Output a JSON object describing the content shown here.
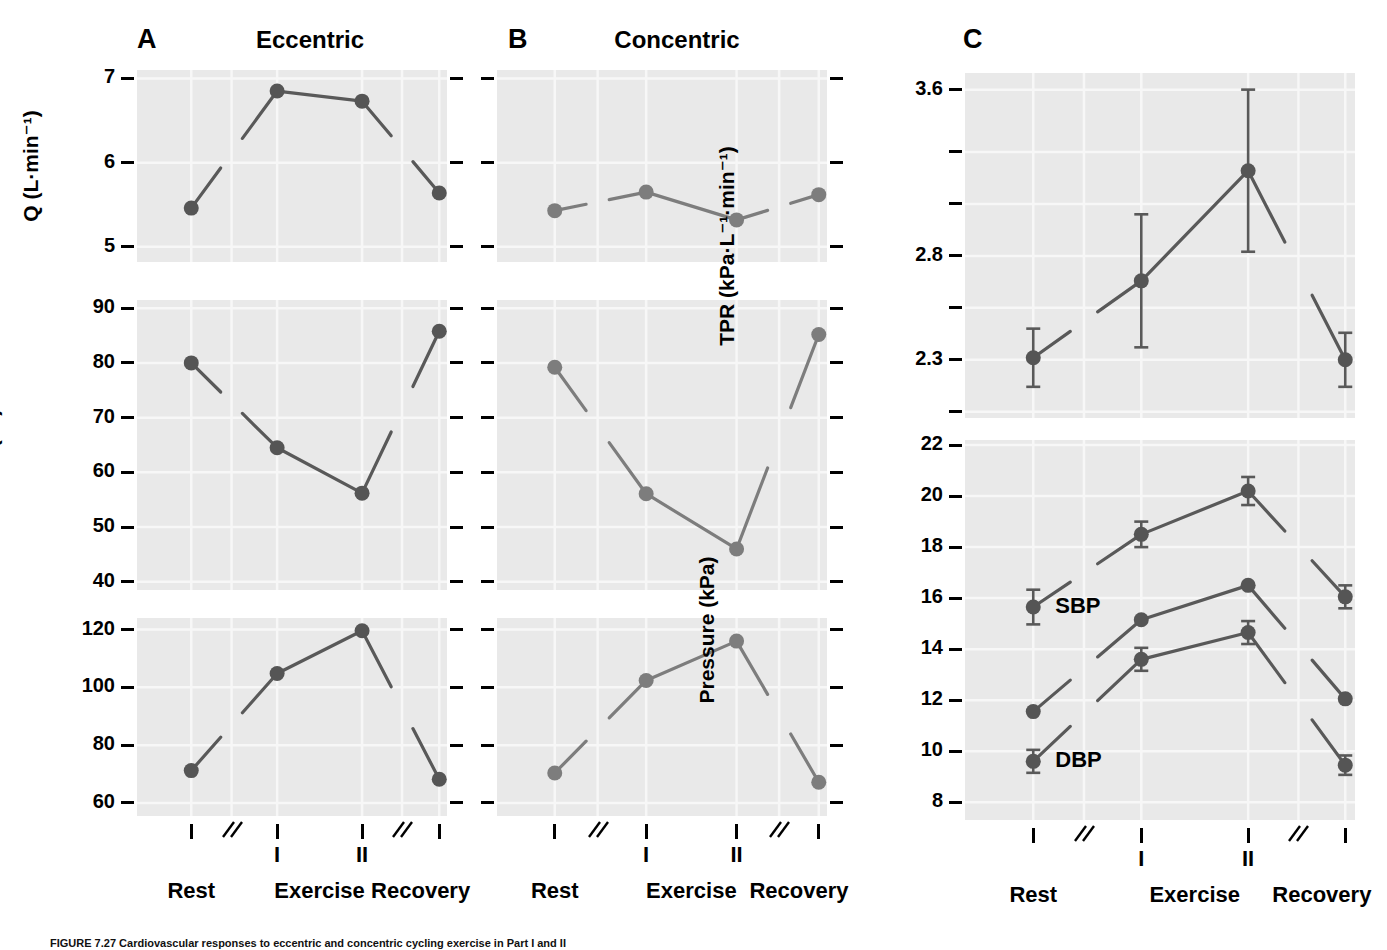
{
  "figure": {
    "caption": "FIGURE 7.27  Cardiovascular responses to eccentric and concentric cycling exercise in Part I and II",
    "columns": [
      {
        "letter": "A",
        "title": "Eccentric"
      },
      {
        "letter": "B",
        "title": "Concentric"
      },
      {
        "letter": "C",
        "title": ""
      }
    ],
    "x_categories": [
      "Rest",
      "Exercise",
      "Recovery"
    ],
    "x_roman": [
      "I",
      "II"
    ],
    "axis_break_symbol": "//",
    "colors": {
      "plot_background": "#e9e9e9",
      "gridline": "#f7f7f7",
      "line": "#595959",
      "marker": "#555555",
      "marker_light": "#7d7d7d",
      "text": "#000000"
    }
  },
  "chart_data": [
    {
      "id": "q-eccentric",
      "type": "line",
      "panel": "A",
      "title": "Eccentric",
      "ylabel": "Q (L·min⁻¹)",
      "xlabel": "",
      "ylim": [
        4.82,
        7.1
      ],
      "yticks": [
        5,
        6,
        7
      ],
      "yticklabels": [
        "5",
        "6",
        "7"
      ],
      "categories": [
        "Rest",
        "I",
        "II",
        "Recovery"
      ],
      "values": [
        5.46,
        6.85,
        6.73,
        5.64
      ],
      "grid": true,
      "legend": "none",
      "errors": null
    },
    {
      "id": "q-concentric",
      "type": "line",
      "panel": "B",
      "title": "Concentric",
      "ylabel": "",
      "xlabel": "",
      "ylim": [
        4.82,
        7.1
      ],
      "yticks": [
        5,
        6,
        7
      ],
      "yticklabels": [
        "",
        "",
        ""
      ],
      "categories": [
        "Rest",
        "I",
        "II",
        "Recovery"
      ],
      "values": [
        5.43,
        5.65,
        5.32,
        5.62
      ],
      "grid": true,
      "legend": "none",
      "errors": null
    },
    {
      "id": "sv-eccentric",
      "type": "line",
      "panel": "A",
      "title": "",
      "ylabel": "SV (ml)",
      "xlabel": "",
      "ylim": [
        38.5,
        91.5
      ],
      "yticks": [
        40,
        50,
        60,
        70,
        80,
        90
      ],
      "yticklabels": [
        "40",
        "50",
        "60",
        "70",
        "80",
        "90"
      ],
      "categories": [
        "Rest",
        "I",
        "II",
        "Recovery"
      ],
      "values": [
        80.0,
        64.5,
        56.2,
        85.8
      ],
      "grid": true,
      "legend": "none",
      "errors": null
    },
    {
      "id": "sv-concentric",
      "type": "line",
      "panel": "B",
      "title": "",
      "ylabel": "",
      "xlabel": "",
      "ylim": [
        38.5,
        91.5
      ],
      "yticks": [
        40,
        50,
        60,
        70,
        80,
        90
      ],
      "yticklabels": [
        "",
        "",
        "",
        "",
        "",
        ""
      ],
      "categories": [
        "Rest",
        "I",
        "II",
        "Recovery"
      ],
      "values": [
        79.2,
        56.1,
        46.0,
        85.2
      ],
      "grid": true,
      "legend": "none",
      "errors": null
    },
    {
      "id": "hr-eccentric",
      "type": "line",
      "panel": "A",
      "title": "",
      "ylabel": "HR (bt·min⁻¹)",
      "xlabel": "",
      "ylim": [
        55.5,
        124
      ],
      "yticks": [
        60,
        80,
        100,
        120
      ],
      "yticklabels": [
        "60",
        "80",
        "100",
        "120"
      ],
      "categories": [
        "Rest",
        "I",
        "II",
        "Recovery"
      ],
      "values": [
        71.2,
        104.8,
        119.6,
        68.2
      ],
      "grid": true,
      "legend": "none",
      "errors": null
    },
    {
      "id": "hr-concentric",
      "type": "line",
      "panel": "B",
      "title": "",
      "ylabel": "",
      "xlabel": "",
      "ylim": [
        55.5,
        124
      ],
      "yticks": [
        60,
        80,
        100,
        120
      ],
      "yticklabels": [
        "",
        "",
        "",
        ""
      ],
      "categories": [
        "Rest",
        "I",
        "II",
        "Recovery"
      ],
      "values": [
        70.4,
        102.4,
        116.0,
        67.2
      ],
      "grid": true,
      "legend": "none",
      "errors": null
    },
    {
      "id": "tpr",
      "type": "line",
      "panel": "C",
      "title": "",
      "ylabel": "TPR (kPa·L⁻¹·min⁻¹)",
      "xlabel": "",
      "ylim": [
        2.02,
        3.68
      ],
      "yticks": [
        2.05,
        2.3,
        2.55,
        2.8,
        3.05,
        3.3,
        3.6
      ],
      "yticklabels": [
        "",
        "2.3",
        "",
        "2.8",
        "",
        "",
        "3.6"
      ],
      "categories": [
        "Rest",
        "I",
        "II",
        "Recovery"
      ],
      "values": [
        2.31,
        2.68,
        3.21,
        2.3
      ],
      "errors": [
        0.14,
        0.32,
        0.39,
        0.13
      ],
      "grid": true,
      "legend": "none"
    },
    {
      "id": "pressure",
      "type": "line",
      "panel": "C",
      "title": "",
      "ylabel": "Pressure (kPa)",
      "xlabel": "",
      "ylim": [
        7.3,
        22.2
      ],
      "yticks": [
        8,
        10,
        12,
        14,
        16,
        18,
        20,
        22
      ],
      "yticklabels": [
        "8",
        "10",
        "12",
        "14",
        "16",
        "18",
        "20",
        "22"
      ],
      "categories": [
        "Rest",
        "I",
        "II",
        "Recovery"
      ],
      "grid": true,
      "legend": "inline-labels",
      "series": [
        {
          "name": "SBP",
          "label_shown": true,
          "values": [
            15.65,
            18.5,
            20.2,
            16.05
          ],
          "errors": [
            0.68,
            0.5,
            0.55,
            0.45
          ]
        },
        {
          "name": "MAP",
          "label_shown": false,
          "values": [
            11.55,
            15.15,
            16.5,
            12.05
          ],
          "errors": [
            0,
            0,
            0,
            0
          ]
        },
        {
          "name": "DBP",
          "label_shown": true,
          "values": [
            9.6,
            13.6,
            14.65,
            9.45
          ],
          "errors": [
            0.45,
            0.45,
            0.45,
            0.38
          ]
        }
      ]
    }
  ]
}
